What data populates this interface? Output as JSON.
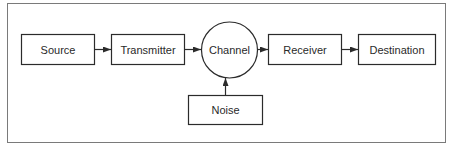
{
  "diagram": {
    "type": "flow",
    "title": "",
    "colors": {
      "stroke": "#2b2b2b",
      "frame": "#7a7a7a",
      "background": "#ffffff",
      "text": "#2a2a2a"
    },
    "nodes": [
      {
        "id": "source",
        "label": "Source",
        "shape": "rect"
      },
      {
        "id": "transmitter",
        "label": "Transmitter",
        "shape": "rect"
      },
      {
        "id": "channel",
        "label": "Channel",
        "shape": "circle"
      },
      {
        "id": "receiver",
        "label": "Receiver",
        "shape": "rect"
      },
      {
        "id": "destination",
        "label": "Destination",
        "shape": "rect"
      },
      {
        "id": "noise",
        "label": "Noise",
        "shape": "rect"
      }
    ],
    "edges": [
      {
        "from": "source",
        "to": "transmitter"
      },
      {
        "from": "transmitter",
        "to": "channel"
      },
      {
        "from": "channel",
        "to": "receiver"
      },
      {
        "from": "receiver",
        "to": "destination"
      },
      {
        "from": "noise",
        "to": "channel"
      }
    ]
  }
}
